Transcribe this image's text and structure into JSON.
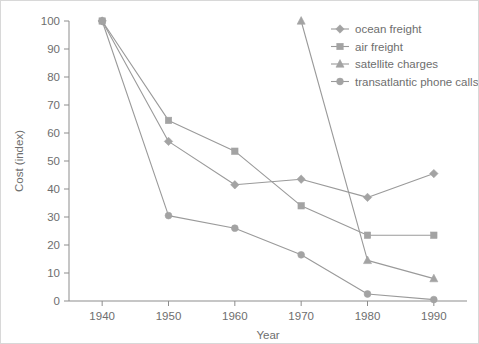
{
  "chart_data": {
    "type": "line",
    "title": "",
    "xlabel": "Year",
    "ylabel": "Cost (index)",
    "x": [
      1940,
      1950,
      1960,
      1970,
      1980,
      1990
    ],
    "xlim": [
      1935,
      1995
    ],
    "ylim": [
      0,
      100
    ],
    "xticks": [
      "1940",
      "1950",
      "1960",
      "1970",
      "1980",
      "1990"
    ],
    "yticks": [
      "0",
      "10",
      "20",
      "30",
      "40",
      "50",
      "60",
      "70",
      "80",
      "90",
      "100"
    ],
    "grid": false,
    "legend_position": "top-right",
    "series": [
      {
        "name": "ocean freight",
        "marker": "diamond",
        "color": "#a3a3a3",
        "x": [
          1940,
          1950,
          1960,
          1970,
          1980,
          1990
        ],
        "values": [
          100,
          57,
          41.5,
          43.5,
          37,
          45.5
        ]
      },
      {
        "name": "air freight",
        "marker": "square",
        "color": "#a3a3a3",
        "x": [
          1940,
          1950,
          1960,
          1970,
          1980,
          1990
        ],
        "values": [
          100,
          64.5,
          53.5,
          34,
          23.5,
          23.5
        ]
      },
      {
        "name": "satellite charges",
        "marker": "triangle",
        "color": "#a3a3a3",
        "x": [
          1970,
          1980,
          1990
        ],
        "values": [
          100,
          14.5,
          8
        ]
      },
      {
        "name": "transatlantic phone calls",
        "marker": "circle",
        "color": "#a3a3a3",
        "x": [
          1940,
          1950,
          1960,
          1970,
          1980,
          1990
        ],
        "values": [
          100,
          30.5,
          26,
          16.5,
          2.5,
          0.5
        ]
      }
    ]
  },
  "axes": {
    "x_title": "Year",
    "y_title": "Cost (index)"
  },
  "legend": {
    "items": [
      {
        "label": "ocean freight"
      },
      {
        "label": "air freight"
      },
      {
        "label": "satellite charges"
      },
      {
        "label": "transatlantic phone calls"
      }
    ]
  }
}
